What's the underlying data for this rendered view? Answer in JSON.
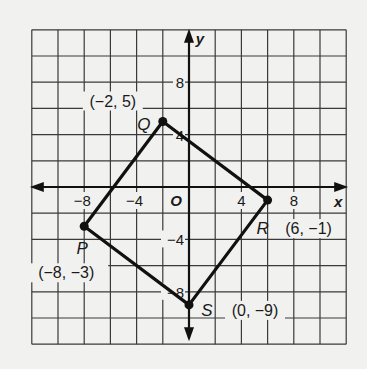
{
  "diagram": {
    "type": "coordinate-plane",
    "background": "#f1f1f0",
    "grid": {
      "xmin": -12,
      "xmax": 12,
      "ymin": -12,
      "ymax": 12,
      "step": 2,
      "line_color": "#3a3a3a",
      "axis_color": "#111111"
    },
    "axes": {
      "x_label": "x",
      "y_label": "y",
      "origin_label": "O",
      "x_ticks": [
        {
          "value": -8,
          "label": "−8"
        },
        {
          "value": -4,
          "label": "−4"
        },
        {
          "value": 4,
          "label": "4"
        },
        {
          "value": 8,
          "label": "8"
        }
      ],
      "y_ticks": [
        {
          "value": 8,
          "label": "8"
        },
        {
          "value": 4,
          "label": "4"
        },
        {
          "value": -4,
          "label": "−4"
        },
        {
          "value": -8,
          "label": "−8"
        }
      ]
    },
    "polygon": {
      "name": "PQRS",
      "stroke": "#111111",
      "vertices": [
        {
          "name": "P",
          "x": -8,
          "y": -3,
          "coord_label": "(−8, −3)"
        },
        {
          "name": "Q",
          "x": -2,
          "y": 5,
          "coord_label": "(−2, 5)"
        },
        {
          "name": "R",
          "x": 6,
          "y": -1,
          "coord_label": "(6, −1)"
        },
        {
          "name": "S",
          "x": 0,
          "y": -9,
          "coord_label": "(0, −9)"
        }
      ]
    }
  }
}
